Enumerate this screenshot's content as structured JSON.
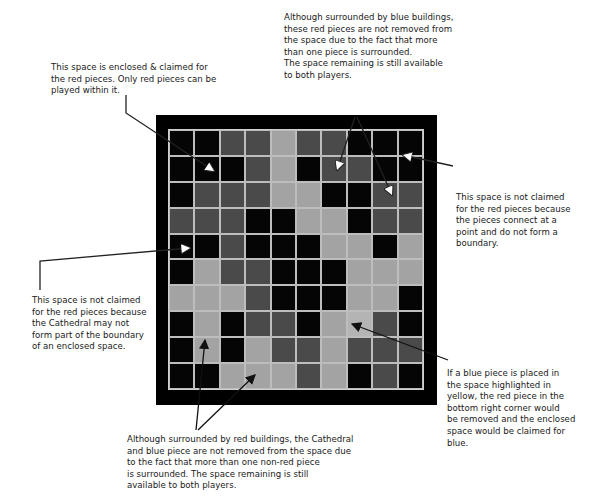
{
  "diagram": {
    "type": "board-territory-illustration",
    "legend": {
      "B": "empty square",
      "R": "red piece (dark grey)",
      "L": "blue piece / Cathedral (light grey)",
      "Y": "space highlighted in yellow"
    },
    "colors": {
      "board_frame": "#000000",
      "empty": "#050505",
      "red": "#4a4a4a",
      "blue": "#a3a3a3",
      "highlight": "#b4b4b4",
      "grid_line": "#bdbdbd"
    },
    "grid": [
      [
        "B",
        "B",
        "R",
        "R",
        "L",
        "R",
        "R",
        "B",
        "B",
        "B"
      ],
      [
        "B",
        "B",
        "B",
        "R",
        "L",
        "B",
        "R",
        "R",
        "B",
        "B"
      ],
      [
        "B",
        "R",
        "R",
        "R",
        "L",
        "L",
        "B",
        "B",
        "R",
        "R"
      ],
      [
        "R",
        "R",
        "R",
        "B",
        "B",
        "L",
        "L",
        "B",
        "R",
        "R"
      ],
      [
        "B",
        "B",
        "R",
        "B",
        "B",
        "B",
        "L",
        "L",
        "B",
        "L"
      ],
      [
        "B",
        "L",
        "R",
        "R",
        "B",
        "B",
        "B",
        "L",
        "L",
        "L"
      ],
      [
        "L",
        "L",
        "L",
        "R",
        "B",
        "B",
        "B",
        "L",
        "L",
        "B"
      ],
      [
        "B",
        "L",
        "B",
        "R",
        "R",
        "B",
        "L",
        "Y",
        "R",
        "B"
      ],
      [
        "B",
        "L",
        "B",
        "L",
        "R",
        "R",
        "L",
        "R",
        "R",
        "R"
      ],
      [
        "B",
        "B",
        "L",
        "L",
        "L",
        "R",
        "L",
        "B",
        "R",
        "B"
      ]
    ]
  },
  "notes": {
    "top_left": "This space is enclosed & claimed for\nthe red pieces. Only red pieces can be\nplayed within it.",
    "top_center": "Although surrounded by blue buildings,\nthese red pieces are not removed from\nthe space due to the fact that more\nthan one piece is surrounded.\nThe space remaining is still available\nto both players.",
    "right_upper": "This space is not claimed\nfor the red pieces because\nthe pieces connect at a\npoint and do not form a\nboundary.",
    "left_middle": "This space is not claimed\nfor the red pieces because\nthe Cathedral may not\nform part of the boundary\nof an enclosed space.",
    "right_lower": "If a blue piece is placed in\nthe space highlighted in\nyellow, the red piece in the\nbottom right corner would\nbe removed and the enclosed\nspace would be claimed for\nblue.",
    "bottom": "Although surrounded by red buildings, the Cathedral\nand blue piece are not removed from the space due\nto the fact that more than one non-red piece\nis surrounded. The space remaining is still\navailable to both players."
  }
}
